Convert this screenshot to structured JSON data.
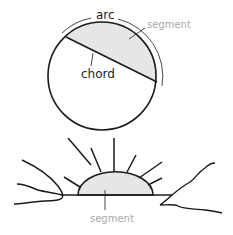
{
  "diagram": {
    "circle_labels": {
      "arc": "arc",
      "segment": "segment",
      "chord": "chord"
    },
    "sunrise_labels": {
      "segment": "segment"
    },
    "colors": {
      "stroke": "#1a1a1a",
      "fill_segment": "#e6e6e6",
      "label_dark": "#222222",
      "label_light": "#a8a8a8"
    }
  }
}
